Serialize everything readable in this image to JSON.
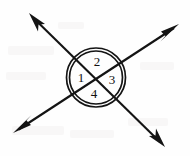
{
  "figure": {
    "background_color": "#fefefe",
    "ink_color": "#141414",
    "width": 190,
    "height": 156
  },
  "circle": {
    "name": "double-ring-circle",
    "center_x": 96,
    "center_y": 77.5,
    "outer_radius": 29.5,
    "inner_radius": 26.5,
    "stroke_width": 1.7
  },
  "intersection": {
    "x": 96,
    "y": 77.5,
    "label": "vertex"
  },
  "lines": [
    {
      "name": "line-upper-left-to-lower-right",
      "start_x": 29,
      "start_y": 13,
      "end_x": 165,
      "end_y": 147,
      "arrow_start": true,
      "arrow_end": true
    },
    {
      "name": "line-lower-left-to-upper-right",
      "start_x": 13,
      "start_y": 133,
      "end_x": 179,
      "end_y": 24,
      "arrow_start": true,
      "arrow_end": true
    }
  ],
  "arrowheads": [
    {
      "name": "arrowhead-upper-left",
      "tip_x": 29,
      "tip_y": 13
    },
    {
      "name": "arrowhead-lower-right",
      "tip_x": 165,
      "tip_y": 147
    },
    {
      "name": "arrowhead-lower-left",
      "tip_x": 13,
      "tip_y": 133
    },
    {
      "name": "arrowhead-upper-right",
      "tip_x": 179,
      "tip_y": 24
    }
  ],
  "angle_labels": [
    {
      "name": "angle-label-1",
      "text": "1",
      "x": 81,
      "y": 77
    },
    {
      "name": "angle-label-2",
      "text": "2",
      "x": 97,
      "y": 61
    },
    {
      "name": "angle-label-3",
      "text": "3",
      "x": 112,
      "y": 79
    },
    {
      "name": "angle-label-4",
      "text": "4",
      "x": 94,
      "y": 93
    }
  ]
}
